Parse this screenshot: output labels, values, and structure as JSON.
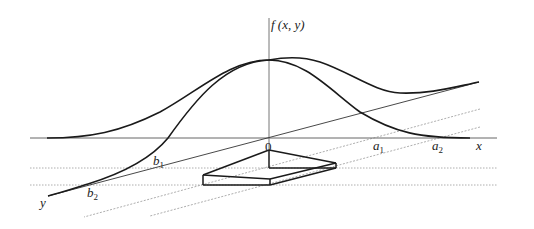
{
  "diagram": {
    "type": "3d-surface-cross-sections",
    "labels": {
      "z_axis": "f (x, y)",
      "x_axis": "x",
      "y_axis": "y",
      "origin": "0",
      "a1": "a",
      "a1_sub": "1",
      "a2": "a",
      "a2_sub": "2",
      "b1": "b",
      "b1_sub": "1",
      "b2": "b",
      "b2_sub": "2"
    },
    "colors": {
      "curve": "#1a1a1a",
      "axis": "#555555",
      "dotted": "#999999",
      "background": "#ffffff"
    }
  }
}
